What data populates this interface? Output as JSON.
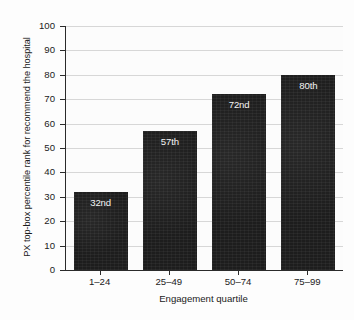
{
  "chart_data": {
    "type": "bar",
    "title": "",
    "xlabel": "Engagement quartile",
    "ylabel": "PX top-box percentile rank for recommend the hospital",
    "categories": [
      "1–24",
      "25–49",
      "50–74",
      "75–99"
    ],
    "values": [
      32,
      57,
      72,
      80
    ],
    "data_labels": [
      "32nd",
      "57th",
      "72nd",
      "80th"
    ],
    "ylim": [
      0,
      100
    ],
    "yticks": [
      0,
      10,
      20,
      30,
      40,
      50,
      60,
      70,
      80,
      90,
      100
    ],
    "ytick_labels": [
      "0",
      "10",
      "20",
      "30",
      "40",
      "50",
      "60",
      "70",
      "80",
      "90",
      "100"
    ],
    "grid": "horizontal",
    "legend": "none",
    "bar_color": "#1d1d1d",
    "grid_color": "#d7d7d7",
    "axis_color": "#2b2b2b",
    "label_text_color": "#f4f4f4",
    "background_color": "#fdfdfd"
  }
}
